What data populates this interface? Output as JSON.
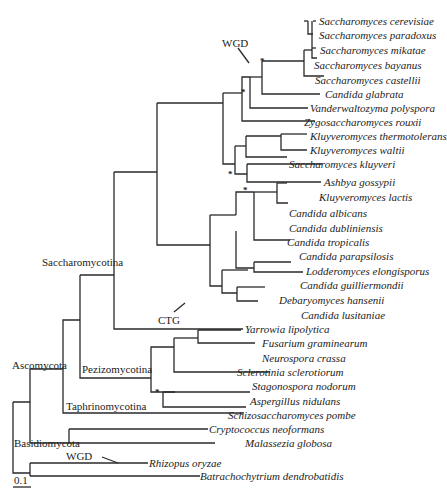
{
  "figure": {
    "type": "phylogenetic-tree",
    "scale_bar": "0.1",
    "event_labels": {
      "wgd_top": "WGD",
      "ctg": "CTG",
      "wgd_bottom": "WGD"
    },
    "clade_labels": {
      "saccharomycotina": "Saccharomycotina",
      "pezizomycotina": "Pezizomycotina",
      "taphrinomycotina": "Taphrinomycotina",
      "ascomycota": "Ascomycota",
      "basidiomycota": "Basidiomycota"
    },
    "support_marker": "*",
    "species": [
      "Saccharomyces cerevisiae",
      "Saccharomyces paradoxus",
      "Saccharomyces mikatae",
      "Saccharomyces bayanus",
      "Saccharomyces castellii",
      "Candida glabrata",
      "Vanderwaltozyma polyspora",
      "Zygosaccharomyces rouxii",
      "Kluyveromyces thermotolerans",
      "Kluyveromyces waltii",
      "Saccharomyces kluyveri",
      "Ashbya gossypii",
      "Kluyveromyces lactis",
      "Candida albicans",
      "Candida dubliniensis",
      "Candida tropicalis",
      "Candida parapsilosis",
      "Lodderomyces elongisporus",
      "Candida guilliermondii",
      "Debaryomyces hansenii",
      "Candida lusitaniae",
      "Yarrowia lipolytica",
      "Fusarium graminearum",
      "Neurospora crassa",
      "Sclerotinia sclerotiorum",
      "Stagonospora nodorum",
      "Aspergillus nidulans",
      "Schizosaccharomyces pombe",
      "Cryptococcus neoformans",
      "Malassezia globosa",
      "Rhizopus oryzae",
      "Batrachochytrium dendrobatidis"
    ]
  }
}
